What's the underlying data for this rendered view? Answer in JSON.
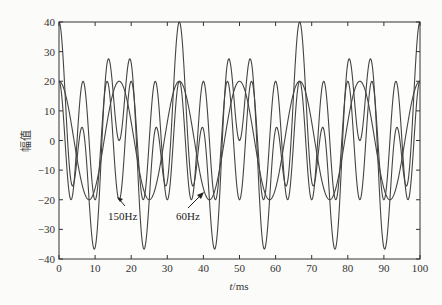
{
  "chart_data": {
    "type": "line",
    "title": "",
    "xlabel": "t/ms",
    "ylabel": "幅值",
    "xlim": [
      0,
      100
    ],
    "ylim": [
      -40,
      40
    ],
    "xticks": [
      0,
      10,
      20,
      30,
      40,
      50,
      60,
      70,
      80,
      90,
      100
    ],
    "yticks": [
      -40,
      -30,
      -20,
      -10,
      0,
      10,
      20,
      30,
      40
    ],
    "grid": false,
    "legend": null,
    "series": [
      {
        "name": "60Hz",
        "formula": "20*cos(2*pi*60*t/1000)",
        "amplitude": 20,
        "frequency_hz": 60
      },
      {
        "name": "150Hz",
        "formula": "20*cos(2*pi*150*t/1000)",
        "amplitude": 20,
        "frequency_hz": 150
      },
      {
        "name": "60Hz+150Hz",
        "formula": "20*cos(2*pi*60*t/1000)+20*cos(2*pi*150*t/1000)",
        "amplitude": 40,
        "frequency_hz": 30
      }
    ],
    "annotations": [
      {
        "text": "150Hz",
        "arrow_to": [
          16.5,
          -20
        ]
      },
      {
        "text": "60Hz",
        "arrow_to": [
          39.5,
          -13
        ]
      }
    ]
  },
  "axes": {
    "xlabel_italic": "t",
    "xlabel_unit": "/ms",
    "ylabel": "幅值"
  },
  "annotations": {
    "a150": "150Hz",
    "a60": "60Hz"
  }
}
